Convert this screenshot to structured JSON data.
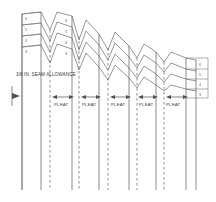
{
  "diagram": {
    "type": "sewing-pattern-schematic",
    "seam_allowance_label": "3/8 IN. SEAM ALLOWANCE",
    "pleat_label": "PLEAT",
    "pleat_count": 5,
    "pleat_labels": [
      "PLEAT",
      "PLEAT",
      "PLEAT",
      "PLEAT",
      "PLEAT"
    ],
    "layer_numbers_left": [
      "6",
      "5",
      "4",
      "3"
    ],
    "layer_numbers_right": [
      "6",
      "5",
      "4",
      "3"
    ],
    "wave_line_count": 4,
    "colors": {
      "background": "#ffffff",
      "line": "#75757a",
      "text": "#3b3b3b",
      "dashed_fold": "#7c7c81"
    },
    "pleat_arrow_positions_x": [
      68,
      107,
      134,
      160,
      186
    ],
    "pleat_label_positions_x": [
      62,
      100,
      128,
      154,
      180
    ],
    "fold_lines": [
      {
        "x": 22,
        "style": "solid"
      },
      {
        "x": 41,
        "style": "solid"
      },
      {
        "x": 50,
        "style": "dashed"
      },
      {
        "x": 79,
        "style": "dashed"
      },
      {
        "x": 72,
        "style": "solid"
      },
      {
        "x": 99,
        "style": "solid"
      },
      {
        "x": 108,
        "style": "dashed"
      },
      {
        "x": 129,
        "style": "solid"
      },
      {
        "x": 137,
        "style": "dashed"
      },
      {
        "x": 156,
        "style": "solid"
      },
      {
        "x": 164,
        "style": "dashed"
      },
      {
        "x": 186,
        "style": "solid"
      },
      {
        "x": 196,
        "style": "solid"
      }
    ],
    "grain_arrow": {
      "name": "grain-direction-arrow",
      "x": 12,
      "y": 96
    }
  }
}
